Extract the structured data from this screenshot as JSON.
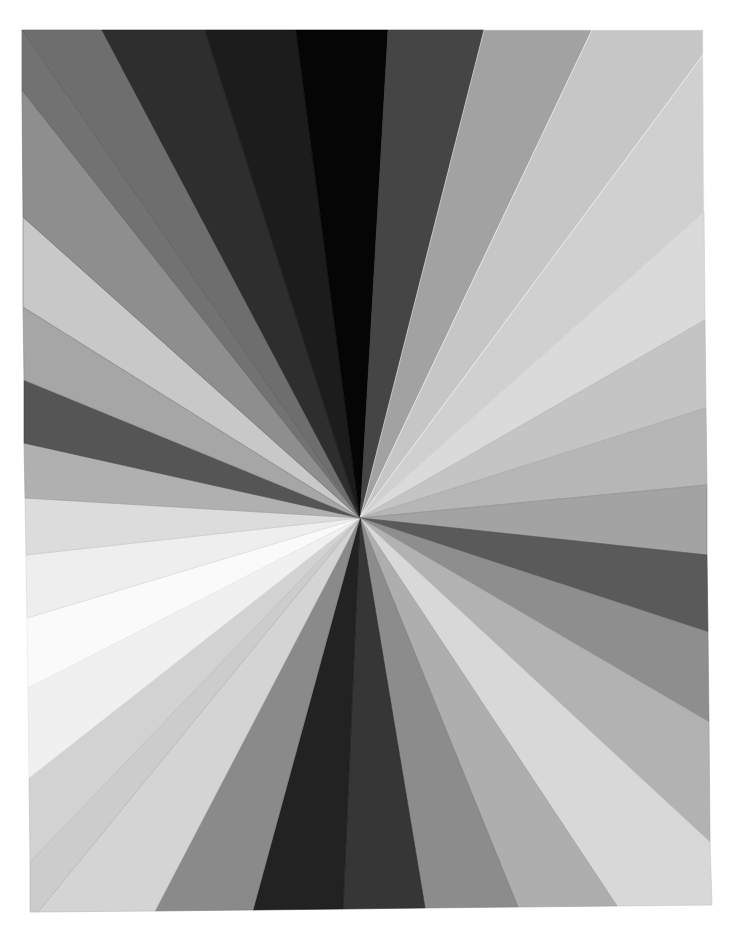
{
  "image": {
    "subject": "Radial starburst of grayscale paper strips",
    "background_color": "#ffffff",
    "center": [
      360,
      518
    ],
    "frame": {
      "top_left": [
        22,
        30
      ],
      "top_right": [
        703,
        30
      ],
      "bottom_right": [
        712,
        905
      ],
      "bottom_left": [
        30,
        912
      ]
    },
    "wedges": [
      {
        "name": "top-left-corner-gray",
        "points": [
          [
            22,
            30
          ],
          [
            102,
            30
          ]
        ],
        "fill": "#6e6e6e",
        "edge": "#5a5a5a"
      },
      {
        "name": "top-dark-gray-1",
        "points": [
          [
            102,
            30
          ],
          [
            205,
            30
          ]
        ],
        "fill": "#2e2e2e",
        "edge": "#222222"
      },
      {
        "name": "top-dark-gray-2",
        "points": [
          [
            205,
            30
          ],
          [
            296,
            30
          ]
        ],
        "fill": "#1c1c1c",
        "edge": "#141414"
      },
      {
        "name": "top-black",
        "points": [
          [
            296,
            30
          ],
          [
            388,
            30
          ]
        ],
        "fill": "#050505",
        "edge": "#000000"
      },
      {
        "name": "top-charcoal",
        "points": [
          [
            388,
            30
          ],
          [
            484,
            30
          ]
        ],
        "fill": "#454545",
        "edge": "#3a3a3a"
      },
      {
        "name": "top-mid-gray",
        "points": [
          [
            484,
            30
          ],
          [
            592,
            30
          ]
        ],
        "fill": "#a2a2a2",
        "edge": "#e4e4e4"
      },
      {
        "name": "top-light-gray",
        "points": [
          [
            592,
            30
          ],
          [
            703,
            30
          ],
          [
            703,
            55
          ]
        ],
        "fill": "#c6c6c6",
        "edge": "#eeeeee"
      },
      {
        "name": "right-pale-1",
        "points": [
          [
            703,
            55
          ],
          [
            704,
            212
          ]
        ],
        "fill": "#d0d0d0",
        "edge": "#f2f2f2"
      },
      {
        "name": "right-pale-2",
        "points": [
          [
            704,
            212
          ],
          [
            705,
            320
          ]
        ],
        "fill": "#dadada",
        "edge": "#c8c8c8"
      },
      {
        "name": "right-light-gray-1",
        "points": [
          [
            705,
            320
          ],
          [
            706,
            408
          ]
        ],
        "fill": "#c4c4c4",
        "edge": "#b4b4b4"
      },
      {
        "name": "right-light-gray-2",
        "points": [
          [
            706,
            408
          ],
          [
            707,
            485
          ]
        ],
        "fill": "#b6b6b6",
        "edge": "#a4a4a4"
      },
      {
        "name": "right-mid-gray",
        "points": [
          [
            707,
            485
          ],
          [
            707,
            555
          ]
        ],
        "fill": "#a3a3a3",
        "edge": "#8a8a8a"
      },
      {
        "name": "right-dark-gray",
        "points": [
          [
            707,
            555
          ],
          [
            708,
            632
          ]
        ],
        "fill": "#5a5a5a",
        "edge": "#4a4a4a"
      },
      {
        "name": "right-gray",
        "points": [
          [
            708,
            632
          ],
          [
            709,
            722
          ]
        ],
        "fill": "#8e8e8e",
        "edge": "#7e7e7e"
      },
      {
        "name": "right-silver",
        "points": [
          [
            709,
            722
          ],
          [
            710,
            842
          ]
        ],
        "fill": "#b2b2b2",
        "edge": "#a0a0a0"
      },
      {
        "name": "bottom-right-pale",
        "points": [
          [
            710,
            842
          ],
          [
            712,
            905
          ],
          [
            617,
            906
          ]
        ],
        "fill": "#d8d8d8",
        "edge": "#c4c4c4"
      },
      {
        "name": "bottom-silver",
        "points": [
          [
            617,
            906
          ],
          [
            518,
            907
          ]
        ],
        "fill": "#aeaeae",
        "edge": "#9a9a9a"
      },
      {
        "name": "bottom-gray",
        "points": [
          [
            518,
            907
          ],
          [
            425,
            908
          ]
        ],
        "fill": "#8c8c8c",
        "edge": "#7a7a7a"
      },
      {
        "name": "bottom-charcoal",
        "points": [
          [
            425,
            908
          ],
          [
            343,
            909
          ]
        ],
        "fill": "#363636",
        "edge": "#2a2a2a"
      },
      {
        "name": "bottom-near-black",
        "points": [
          [
            343,
            909
          ],
          [
            253,
            910
          ]
        ],
        "fill": "#222222",
        "edge": "#1a1a1a"
      },
      {
        "name": "bottom-mid-gray",
        "points": [
          [
            253,
            910
          ],
          [
            155,
            911
          ]
        ],
        "fill": "#8a8a8a",
        "edge": "#7a7a7a"
      },
      {
        "name": "bottom-pale",
        "points": [
          [
            155,
            911
          ],
          [
            38,
            912
          ]
        ],
        "fill": "#d4d4d4",
        "edge": "#b8b8b8"
      },
      {
        "name": "bottom-left-corner-pale",
        "points": [
          [
            38,
            912
          ],
          [
            30,
            912
          ],
          [
            30,
            862
          ]
        ],
        "fill": "#cccccc",
        "edge": "#b0b0b0"
      },
      {
        "name": "left-light-1",
        "points": [
          [
            30,
            862
          ],
          [
            29,
            778
          ]
        ],
        "fill": "#d2d2d2",
        "edge": "#bdbdbd"
      },
      {
        "name": "left-near-white-1",
        "points": [
          [
            29,
            778
          ],
          [
            28,
            688
          ]
        ],
        "fill": "#f0f0f0",
        "edge": "#e0e0e0"
      },
      {
        "name": "left-white",
        "points": [
          [
            28,
            688
          ],
          [
            27,
            618
          ]
        ],
        "fill": "#fafafa",
        "edge": "#e6e6e6"
      },
      {
        "name": "left-near-white-2",
        "points": [
          [
            27,
            618
          ],
          [
            26,
            555
          ]
        ],
        "fill": "#eeeeee",
        "edge": "#d6d6d6"
      },
      {
        "name": "left-pale",
        "points": [
          [
            26,
            555
          ],
          [
            25,
            498
          ]
        ],
        "fill": "#dcdcdc",
        "edge": "#c6c6c6"
      },
      {
        "name": "left-silver",
        "points": [
          [
            25,
            498
          ],
          [
            24,
            443
          ]
        ],
        "fill": "#b0b0b0",
        "edge": "#9a9a9a"
      },
      {
        "name": "left-dark-gray",
        "points": [
          [
            24,
            443
          ],
          [
            24,
            380
          ]
        ],
        "fill": "#555555",
        "edge": "#444444"
      },
      {
        "name": "left-gray",
        "points": [
          [
            24,
            380
          ],
          [
            23,
            307
          ]
        ],
        "fill": "#a6a6a6",
        "edge": "#8c8c8c"
      },
      {
        "name": "left-light-gray",
        "points": [
          [
            23,
            307
          ],
          [
            23,
            217
          ]
        ],
        "fill": "#c8c8c8",
        "edge": "#7a7a7a"
      },
      {
        "name": "left-mid-gray",
        "points": [
          [
            23,
            217
          ],
          [
            22,
            90
          ]
        ],
        "fill": "#8e8e8e",
        "edge": "#6a6a6a"
      },
      {
        "name": "left-upper-gray",
        "points": [
          [
            22,
            90
          ],
          [
            22,
            30
          ]
        ],
        "fill": "#727272",
        "edge": "#5a5a5a"
      }
    ]
  }
}
